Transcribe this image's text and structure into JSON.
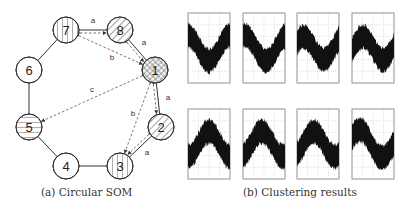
{
  "captions": {
    "left": "(a) Circular SOM",
    "right": "(b) Clustering results"
  },
  "som": {
    "nodes": [
      {
        "id": "1",
        "label": "1",
        "x": 155,
        "y": 70,
        "pattern": "crosshatch"
      },
      {
        "id": "2",
        "label": "2",
        "x": 161,
        "y": 127,
        "pattern": "diagonal"
      },
      {
        "id": "3",
        "label": "3",
        "x": 120,
        "y": 166,
        "pattern": "vertical"
      },
      {
        "id": "4",
        "label": "4",
        "x": 66,
        "y": 166,
        "pattern": "none"
      },
      {
        "id": "5",
        "label": "5",
        "x": 29,
        "y": 127,
        "pattern": "horizontal"
      },
      {
        "id": "6",
        "label": "6",
        "x": 29,
        "y": 70,
        "pattern": "none"
      },
      {
        "id": "7",
        "label": "7",
        "x": 66,
        "y": 30,
        "pattern": "vertical"
      },
      {
        "id": "8",
        "label": "8",
        "x": 120,
        "y": 30,
        "pattern": "diagonal"
      }
    ],
    "ring_edges": [
      [
        "1",
        "2"
      ],
      [
        "2",
        "3"
      ],
      [
        "3",
        "4"
      ],
      [
        "4",
        "5"
      ],
      [
        "5",
        "6"
      ],
      [
        "6",
        "7"
      ],
      [
        "7",
        "8"
      ],
      [
        "8",
        "1"
      ]
    ],
    "similarity_links": [
      {
        "from": "7",
        "to": "8",
        "label": "a"
      },
      {
        "from": "8",
        "to": "1",
        "label": "a"
      },
      {
        "from": "1",
        "to": "2",
        "label": "a"
      },
      {
        "from": "2",
        "to": "3",
        "label": "a"
      },
      {
        "from": "7",
        "to": "1",
        "label": "b"
      },
      {
        "from": "1",
        "to": "3",
        "label": "b"
      },
      {
        "from": "1",
        "to": "5",
        "label": "c"
      }
    ]
  },
  "clusters": {
    "top_row": [
      {
        "shape": "valley",
        "phase": 0.0
      },
      {
        "shape": "valley",
        "phase": 0.05
      },
      {
        "shape": "valley-rising",
        "phase": 0.15
      },
      {
        "shape": "valley-rising",
        "phase": 0.25
      }
    ],
    "bottom_row": [
      {
        "shape": "peak",
        "phase": 0.0
      },
      {
        "shape": "peak",
        "phase": -0.05
      },
      {
        "shape": "peak",
        "phase": -0.1
      },
      {
        "shape": "peak-falling",
        "phase": -0.3
      }
    ]
  },
  "colors": {
    "line": "#333333",
    "dash": "#555555",
    "grid": "#bbbbbb",
    "signal": "#111111"
  }
}
